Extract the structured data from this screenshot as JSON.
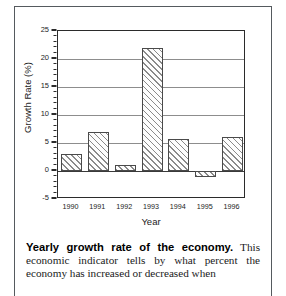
{
  "figure": {
    "chart_data": {
      "type": "bar",
      "title": "",
      "xlabel": "Year",
      "ylabel": "Growth Rate (%)",
      "categories": [
        "1990",
        "1991",
        "1992",
        "1993",
        "1994",
        "1995",
        "1996"
      ],
      "values": [
        3,
        7,
        1,
        22,
        5.8,
        -1,
        6
      ],
      "ylim": [
        -5,
        25
      ],
      "ytick_labels": [
        "-5",
        "0",
        "5",
        "10",
        "15",
        "20",
        "25"
      ],
      "ytick_values": [
        -5,
        0,
        5,
        10,
        15,
        20,
        25
      ],
      "minor_tick_interval": 1,
      "gridlines_at": [
        5,
        10,
        15,
        20
      ],
      "grid": true,
      "legend": "none",
      "bar_fill": "diagonal-hatch",
      "colors": {
        "axis": "#2b2b2b",
        "grid": "#8d8d8d",
        "bar_edge": "#4a4a4a",
        "bar_hatch": "#8a8a8a",
        "bar_face": "#fdfdfd",
        "text": "#1c1c1c"
      }
    }
  },
  "caption": {
    "title": "Yearly growth rate of the economy.",
    "body": " This economic indicator tells by what percent the economy has increased or decreased when"
  }
}
